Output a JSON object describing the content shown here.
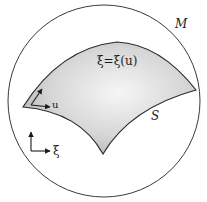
{
  "diagram": {
    "manifold_label": "M",
    "surface_label": "S",
    "map_label": "ξ=ξ(u)",
    "local_coord_label": "u",
    "ambient_coord_label": "ξ",
    "colors": {
      "stroke": "#2a2a2a",
      "surface_fill_center": "#f4f4f4",
      "surface_fill_edge": "#b4b4b4",
      "background": "#ffffff"
    }
  }
}
